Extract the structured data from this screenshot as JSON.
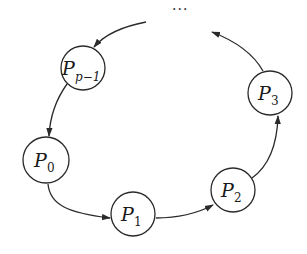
{
  "diagram": {
    "type": "ring",
    "ellipsis": "···",
    "nodes": [
      {
        "id": "Pp-1",
        "base": "P",
        "subscript": "p−1",
        "cx": 83,
        "cy": 68
      },
      {
        "id": "P0",
        "base": "P",
        "subscript": "0",
        "cx": 46,
        "cy": 160
      },
      {
        "id": "P1",
        "base": "P",
        "subscript": "1",
        "cx": 133,
        "cy": 214
      },
      {
        "id": "P2",
        "base": "P",
        "subscript": "2",
        "cx": 233,
        "cy": 190
      },
      {
        "id": "P3",
        "base": "P",
        "subscript": "3",
        "cx": 270,
        "cy": 93
      }
    ],
    "edges": [
      {
        "from": "...",
        "to": "Pp-1"
      },
      {
        "from": "Pp-1",
        "to": "P0"
      },
      {
        "from": "P0",
        "to": "P1"
      },
      {
        "from": "P1",
        "to": "P2"
      },
      {
        "from": "P2",
        "to": "P3"
      },
      {
        "from": "P3",
        "to": "..."
      }
    ],
    "colors": {
      "stroke": "#2a2a2a",
      "background": "#ffffff"
    }
  }
}
